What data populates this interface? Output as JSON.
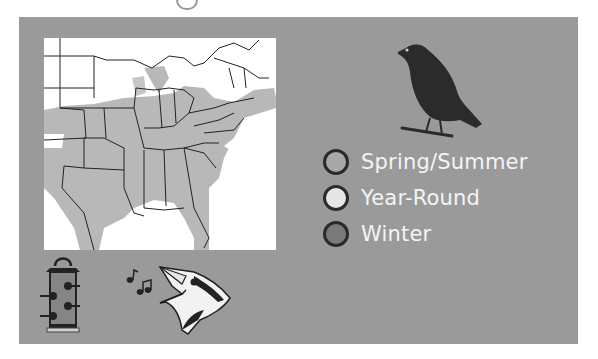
{
  "figure": {
    "type": "bird range map card",
    "panel_color": "#9a9a9a"
  },
  "map": {
    "region": "Eastern United States",
    "range_fill": "#b8b8b8",
    "background": "#ffffff"
  },
  "legend": {
    "items": [
      {
        "label": "Spring/Summer",
        "color": "#a8a8a8"
      },
      {
        "label": "Year-Round",
        "color": "#e6e6e6"
      },
      {
        "label": "Winter",
        "color": "#7a7a7a"
      }
    ]
  },
  "icons": {
    "bird": "bird-silhouette-icon",
    "feeder": "tube-feeder-icon",
    "song": "music-notes-icon",
    "singing_bird": "singing-bird-head-icon"
  }
}
